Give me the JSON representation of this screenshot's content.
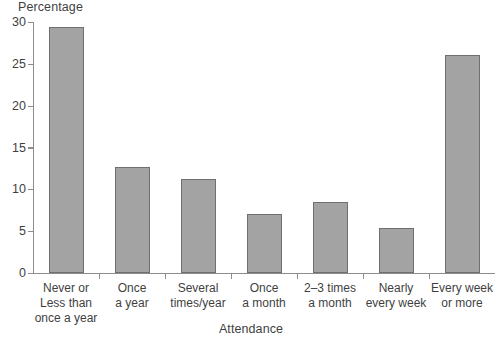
{
  "chart_data": {
    "type": "bar",
    "title": "",
    "xlabel": "Attendance",
    "ylabel": "Percentage",
    "categories": [
      "Never or\nLess than\nonce a year",
      "Once\na year",
      "Several\ntimes/year",
      "Once\na month",
      "2–3 times\na month",
      "Nearly\nevery week",
      "Every week\nor more"
    ],
    "values": [
      29.4,
      12.7,
      11.2,
      7.0,
      8.5,
      5.4,
      26.0
    ],
    "ylim": [
      0,
      30
    ],
    "yticks": [
      0,
      5,
      10,
      15,
      20,
      25,
      30
    ],
    "ytick_labels": [
      "0",
      "5",
      "10",
      "15",
      "20",
      "25",
      "30"
    ],
    "grid": false,
    "legend": "none",
    "bar_fill_color": "#a3a3a3",
    "bar_border_color": "#6f6f6f",
    "axis_color": "#8c8c8c",
    "text_color": "#3f3f3f"
  }
}
